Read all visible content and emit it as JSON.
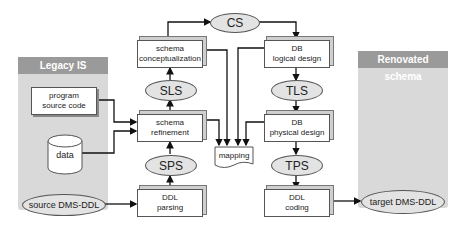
{
  "panels": {
    "legacy": {
      "title": "Legacy IS"
    },
    "renovated": {
      "title": "Renovated schema"
    }
  },
  "legacy_items": {
    "program": [
      "program",
      "source code"
    ],
    "data": "data",
    "source_ddl": "source DMS-DDL"
  },
  "process_boxes": {
    "schema_conceptualization": [
      "schema",
      "conceptualization"
    ],
    "schema_refinement": [
      "schema",
      "refinement"
    ],
    "ddl_parsing": [
      "DDL",
      "parsing"
    ],
    "db_logical_design": [
      "DB",
      "logical design"
    ],
    "db_physical_design": [
      "DB",
      "physical design"
    ],
    "ddl_coding": [
      "DDL",
      "coding"
    ]
  },
  "schemas": {
    "cs": "CS",
    "sls": "SLS",
    "sps": "SPS",
    "tls": "TLS",
    "tps": "TPS"
  },
  "mapping": "mapping",
  "target_ddl": "target DMS-DDL",
  "colors": {
    "panel_bg": "#d9d9d9",
    "panel_header": "#9a9a9a",
    "ellipse_fill": "#e3e3e3",
    "line": "#111111"
  }
}
